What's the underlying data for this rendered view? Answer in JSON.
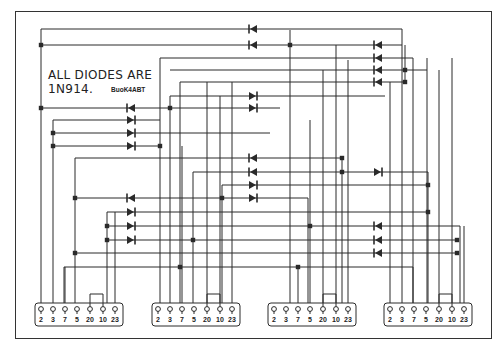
{
  "note": {
    "line1": "ALL DIODES ARE",
    "line2": "1N914."
  },
  "credit": "BuoK4ABT",
  "connectors": [
    {
      "x": 35,
      "pins": [
        "2",
        "3",
        "7",
        "5",
        "20",
        "10",
        "23"
      ]
    },
    {
      "x": 152,
      "pins": [
        "2",
        "3",
        "7",
        "5",
        "20",
        "10",
        "23"
      ]
    },
    {
      "x": 268,
      "pins": [
        "2",
        "3",
        "7",
        "5",
        "20",
        "10",
        "23"
      ]
    },
    {
      "x": 384,
      "pins": [
        "2",
        "3",
        "7",
        "5",
        "20",
        "10",
        "23"
      ]
    }
  ],
  "colors": {
    "ink": "#2a2a2a",
    "background": "#ffffff"
  }
}
